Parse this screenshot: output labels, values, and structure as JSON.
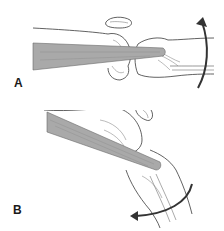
{
  "figure": {
    "panels": [
      {
        "id": "A",
        "label": "A",
        "description": "Knee in extension with graft/tendon through joint; curved arrow indicating upward rotation",
        "arrow_direction": "up"
      },
      {
        "id": "B",
        "label": "B",
        "description": "Knee in flexion with graft/tendon; curved arrow indicating leftward rotation",
        "arrow_direction": "left"
      }
    ],
    "colors": {
      "line": "#3a3a3a",
      "graft_fill": "#a9a9a9",
      "graft_dark": "#8c8c8c",
      "arrow": "#333333",
      "background": "#ffffff"
    }
  }
}
